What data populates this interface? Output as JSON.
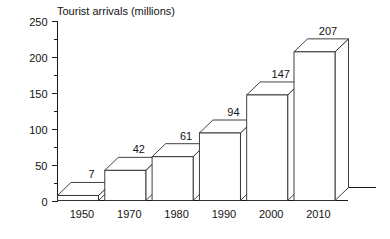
{
  "chart_data": {
    "type": "bar",
    "title": "Tourist arrivals (millions)",
    "xlabel": "",
    "ylabel": "",
    "categories": [
      "1950",
      "1970",
      "1980",
      "1990",
      "2000",
      "2010"
    ],
    "values": [
      7,
      42,
      61,
      94,
      147,
      207
    ],
    "value_labels": [
      "7",
      "42",
      "61",
      "94",
      "147",
      "207"
    ],
    "ylim": [
      0,
      250
    ],
    "ytick_labels": [
      "0",
      "50",
      "100",
      "150",
      "200",
      "250"
    ],
    "ytick_values": [
      0,
      50,
      100,
      150,
      200,
      250
    ],
    "yminor_values": [
      25,
      75,
      125,
      175,
      225
    ],
    "grid": false,
    "legend": "none",
    "style": "3d-isometric-bars",
    "colors": {
      "background": "#ffffff",
      "bar_fill": "#ffffff",
      "bar_stroke": "#2b2b2b",
      "axis": "#1a1a1a",
      "text": "#121212"
    }
  }
}
